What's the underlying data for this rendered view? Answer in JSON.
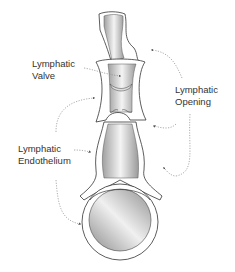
{
  "diagram": {
    "type": "anatomical-illustration",
    "labels": [
      {
        "id": "valve",
        "line1": "Lymphatic",
        "line2": "Valve"
      },
      {
        "id": "opening",
        "line1": "Lymphatic",
        "line2": "Opening"
      },
      {
        "id": "endothelium",
        "line1": "Lymphatic",
        "line2": "Endothelium"
      }
    ],
    "colors": {
      "outline": "#333333",
      "wall": "#ffffff",
      "lumen_light": "#f2f2f2",
      "lumen_dark": "#9a9a9a",
      "label_text": "#333333",
      "leader": "#888888"
    }
  }
}
